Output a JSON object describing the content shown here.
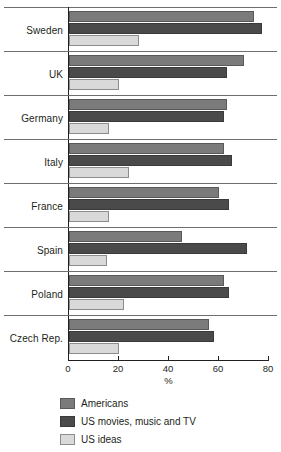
{
  "chart_data": {
    "type": "bar",
    "orientation": "horizontal",
    "title": "",
    "subtitle": "",
    "xlabel": "%",
    "ylabel": "",
    "xlim": [
      0,
      80
    ],
    "xticks": [
      0,
      20,
      40,
      60,
      80
    ],
    "grid": false,
    "legend_position": "bottom-left",
    "categories": [
      "Sweden",
      "UK",
      "Germany",
      "Italy",
      "France",
      "Spain",
      "Poland",
      "Czech Rep."
    ],
    "series": [
      {
        "name": "Americans",
        "color": "#7b7b7b",
        "values": [
          74,
          70,
          63,
          62,
          60,
          45,
          62,
          56
        ]
      },
      {
        "name": "US movies, music and TV",
        "color": "#4a4a4a",
        "values": [
          77,
          63,
          62,
          65,
          64,
          71,
          64,
          58
        ]
      },
      {
        "name": "US ideas",
        "color": "#d9d9d9",
        "values": [
          28,
          20,
          16,
          24,
          16,
          15,
          22,
          20
        ]
      }
    ]
  },
  "axis": {
    "x_title": "%",
    "tick_labels": [
      "0",
      "20",
      "40",
      "60",
      "80"
    ]
  },
  "legend": {
    "items": [
      {
        "label": "Americans",
        "color": "#7b7b7b"
      },
      {
        "label": "US movies, music and TV",
        "color": "#4a4a4a"
      },
      {
        "label": "US ideas",
        "color": "#d9d9d9"
      }
    ]
  }
}
